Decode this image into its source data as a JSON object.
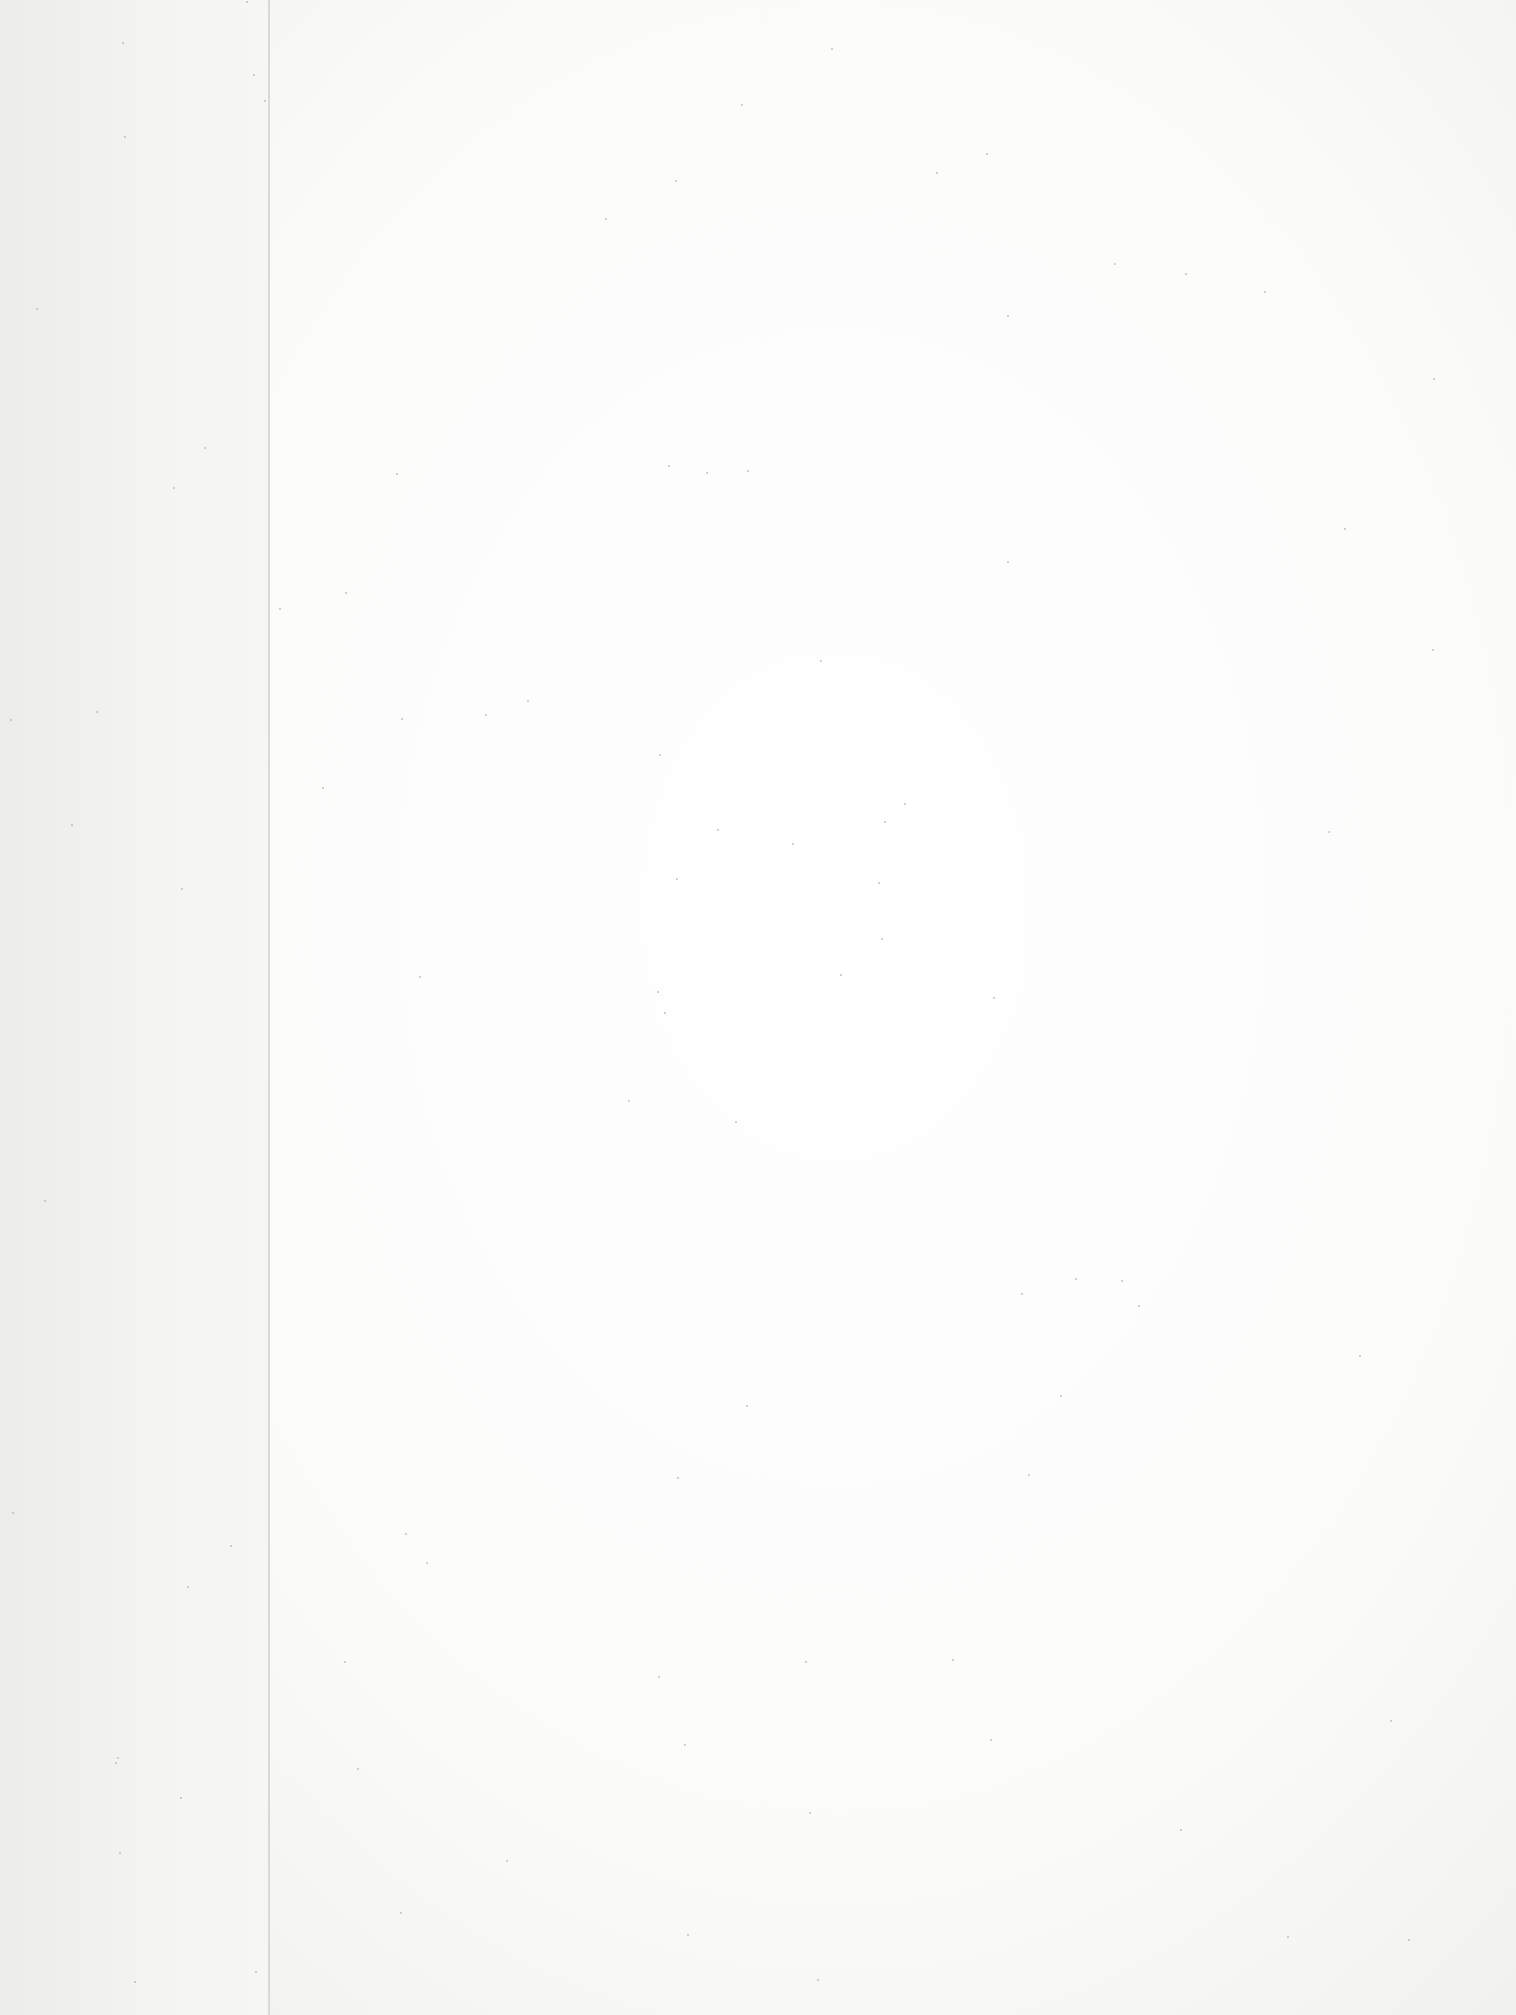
{
  "document": {
    "type": "scanned blank page",
    "text": ""
  }
}
